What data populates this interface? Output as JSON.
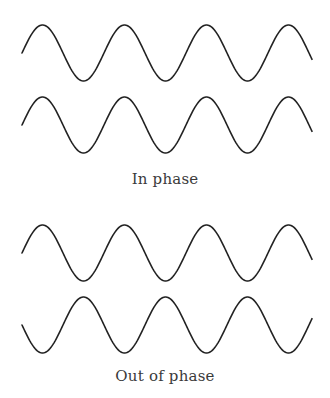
{
  "diagram": {
    "stroke_color": "#222222",
    "text_color": "#3a3a3a",
    "groups": [
      {
        "label": "In phase",
        "waves": [
          {
            "name": "wave-1",
            "x_start": 22,
            "x_end": 312,
            "center_y": 53,
            "amplitude": 28,
            "period": 82,
            "phase": "rising"
          },
          {
            "name": "wave-2",
            "x_start": 22,
            "x_end": 312,
            "center_y": 125,
            "amplitude": 28,
            "period": 82,
            "phase": "rising"
          }
        ]
      },
      {
        "label": "Out of phase",
        "waves": [
          {
            "name": "wave-3",
            "x_start": 22,
            "x_end": 312,
            "center_y": 253,
            "amplitude": 28,
            "period": 82,
            "phase": "rising"
          },
          {
            "name": "wave-4",
            "x_start": 22,
            "x_end": 312,
            "center_y": 325,
            "amplitude": 28,
            "period": 82,
            "phase": "falling"
          }
        ]
      }
    ]
  }
}
